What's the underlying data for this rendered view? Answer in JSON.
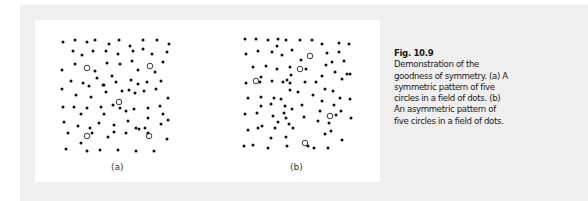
{
  "figure": {
    "number": "Fig. 10.9",
    "caption_lines": [
      "Demonstration of the",
      "goodness of symmetry. (a) A",
      "symmetric pattern of five",
      "circles in a field of dots. (b)",
      "An asymmetric pattern of",
      "five circles in a field of dots."
    ],
    "panels": [
      {
        "label": "(a)",
        "dots": [
          [
            63,
            42
          ],
          [
            75,
            40
          ],
          [
            87,
            42
          ],
          [
            95,
            40
          ],
          [
            109,
            44
          ],
          [
            119,
            40
          ],
          [
            130,
            46
          ],
          [
            143,
            40
          ],
          [
            157,
            40
          ],
          [
            169,
            44
          ],
          [
            73,
            51
          ],
          [
            82,
            55
          ],
          [
            93,
            51
          ],
          [
            106,
            51
          ],
          [
            118,
            54
          ],
          [
            133,
            51
          ],
          [
            143,
            49
          ],
          [
            152,
            54
          ],
          [
            167,
            52
          ],
          [
            62,
            70
          ],
          [
            75,
            64
          ],
          [
            95,
            71
          ],
          [
            107,
            63
          ],
          [
            120,
            64
          ],
          [
            132,
            61
          ],
          [
            138,
            70
          ],
          [
            155,
            72
          ],
          [
            163,
            62
          ],
          [
            71,
            81
          ],
          [
            83,
            83
          ],
          [
            89,
            86
          ],
          [
            97,
            78
          ],
          [
            104,
            85
          ],
          [
            112,
            76
          ],
          [
            116,
            82
          ],
          [
            131,
            80
          ],
          [
            138,
            84
          ],
          [
            147,
            82
          ],
          [
            161,
            81
          ],
          [
            62,
            89
          ],
          [
            76,
            95
          ],
          [
            91,
            97
          ],
          [
            103,
            85
          ],
          [
            106,
            92
          ],
          [
            122,
            91
          ],
          [
            129,
            90
          ],
          [
            135,
            93
          ],
          [
            144,
            91
          ],
          [
            156,
            89
          ],
          [
            168,
            98
          ],
          [
            63,
            107
          ],
          [
            74,
            107
          ],
          [
            87,
            108
          ],
          [
            101,
            107
          ],
          [
            113,
            105
          ],
          [
            120,
            108
          ],
          [
            134,
            109
          ],
          [
            148,
            108
          ],
          [
            160,
            106
          ],
          [
            81,
            114
          ],
          [
            104,
            114
          ],
          [
            126,
            111
          ],
          [
            148,
            118
          ],
          [
            163,
            114
          ],
          [
            168,
            120
          ],
          [
            64,
            122
          ],
          [
            78,
            126
          ],
          [
            90,
            128
          ],
          [
            99,
            123
          ],
          [
            114,
            125
          ],
          [
            128,
            121
          ],
          [
            136,
            128
          ],
          [
            145,
            128
          ],
          [
            161,
            124
          ],
          [
            68,
            133
          ],
          [
            92,
            133
          ],
          [
            108,
            137
          ],
          [
            114,
            132
          ],
          [
            126,
            133
          ],
          [
            139,
            129
          ],
          [
            148,
            133
          ],
          [
            167,
            139
          ],
          [
            66,
            149
          ],
          [
            81,
            143
          ],
          [
            87,
            151
          ],
          [
            100,
            150
          ],
          [
            118,
            150
          ],
          [
            136,
            151
          ],
          [
            154,
            151
          ]
        ],
        "circles": [
          [
            87,
            68
          ],
          [
            150,
            66
          ],
          [
            119,
            102
          ],
          [
            87,
            136
          ],
          [
            149,
            136
          ]
        ]
      },
      {
        "label": "(b)",
        "dots": [
          [
            245,
            39
          ],
          [
            256,
            39
          ],
          [
            268,
            40
          ],
          [
            278,
            39
          ],
          [
            286,
            40
          ],
          [
            300,
            40
          ],
          [
            312,
            40
          ],
          [
            322,
            44
          ],
          [
            339,
            43
          ],
          [
            349,
            44
          ],
          [
            277,
            46
          ],
          [
            246,
            54
          ],
          [
            258,
            51
          ],
          [
            272,
            52
          ],
          [
            282,
            55
          ],
          [
            292,
            50
          ],
          [
            301,
            60
          ],
          [
            327,
            53
          ],
          [
            339,
            52
          ],
          [
            344,
            61
          ],
          [
            332,
            62
          ],
          [
            253,
            67
          ],
          [
            266,
            66
          ],
          [
            277,
            69
          ],
          [
            290,
            67
          ],
          [
            306,
            69
          ],
          [
            326,
            65
          ],
          [
            335,
            72
          ],
          [
            347,
            74
          ],
          [
            291,
            75
          ],
          [
            287,
            80
          ],
          [
            261,
            77
          ],
          [
            260,
            82
          ],
          [
            283,
            82
          ],
          [
            272,
            81
          ],
          [
            290,
            83
          ],
          [
            305,
            82
          ],
          [
            322,
            76
          ],
          [
            316,
            82
          ],
          [
            342,
            79
          ],
          [
            350,
            74
          ],
          [
            246,
            83
          ],
          [
            248,
            98
          ],
          [
            261,
            97
          ],
          [
            274,
            98
          ],
          [
            290,
            90
          ],
          [
            298,
            92
          ],
          [
            313,
            95
          ],
          [
            325,
            89
          ],
          [
            333,
            91
          ],
          [
            340,
            98
          ],
          [
            350,
            99
          ],
          [
            281,
            99
          ],
          [
            271,
            104
          ],
          [
            261,
            106
          ],
          [
            285,
            106
          ],
          [
            302,
            105
          ],
          [
            322,
            101
          ],
          [
            334,
            105
          ],
          [
            245,
            114
          ],
          [
            257,
            113
          ],
          [
            273,
            116
          ],
          [
            284,
            113
          ],
          [
            292,
            109
          ],
          [
            304,
            117
          ],
          [
            320,
            111
          ],
          [
            341,
            111
          ],
          [
            351,
            118
          ],
          [
            286,
            118
          ],
          [
            289,
            124
          ],
          [
            278,
            122
          ],
          [
            262,
            126
          ],
          [
            275,
            128
          ],
          [
            293,
            128
          ],
          [
            318,
            121
          ],
          [
            329,
            123
          ],
          [
            336,
            115
          ],
          [
            248,
            130
          ],
          [
            258,
            128
          ],
          [
            271,
            138
          ],
          [
            286,
            137
          ],
          [
            325,
            134
          ],
          [
            331,
            131
          ],
          [
            342,
            140
          ],
          [
            244,
            146
          ],
          [
            253,
            145
          ],
          [
            268,
            148
          ],
          [
            287,
            146
          ],
          [
            308,
            146
          ],
          [
            314,
            148
          ],
          [
            328,
            148
          ]
        ],
        "circles": [
          [
            310,
            56
          ],
          [
            300,
            69
          ],
          [
            256,
            81
          ],
          [
            330,
            116
          ],
          [
            305,
            143
          ]
        ]
      }
    ]
  },
  "colors": {
    "background": "#efefef",
    "panel": "#ffffff",
    "dot": "#111111",
    "circle_stroke": "#222222",
    "text": "#1a1a1a"
  }
}
